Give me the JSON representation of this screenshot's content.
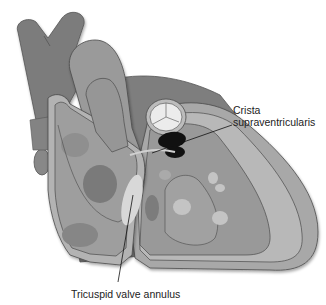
{
  "figure": {
    "labels": {
      "crista_line1": "Crista",
      "crista_line2": "supraventricularis",
      "tricuspid": "Tricuspid valve annulus"
    },
    "colors": {
      "background": "#ffffff",
      "outer_dark": "#7a7a7a",
      "mid_gray": "#8e8e8e",
      "wall_light": "#b4b4b4",
      "chamber": "#9b9b9b",
      "highlight": "#d2d2d2",
      "valve_white": "#ececec",
      "crista_black": "#111111",
      "outline": "#4a4a4a",
      "leader_line": "#111111"
    }
  }
}
